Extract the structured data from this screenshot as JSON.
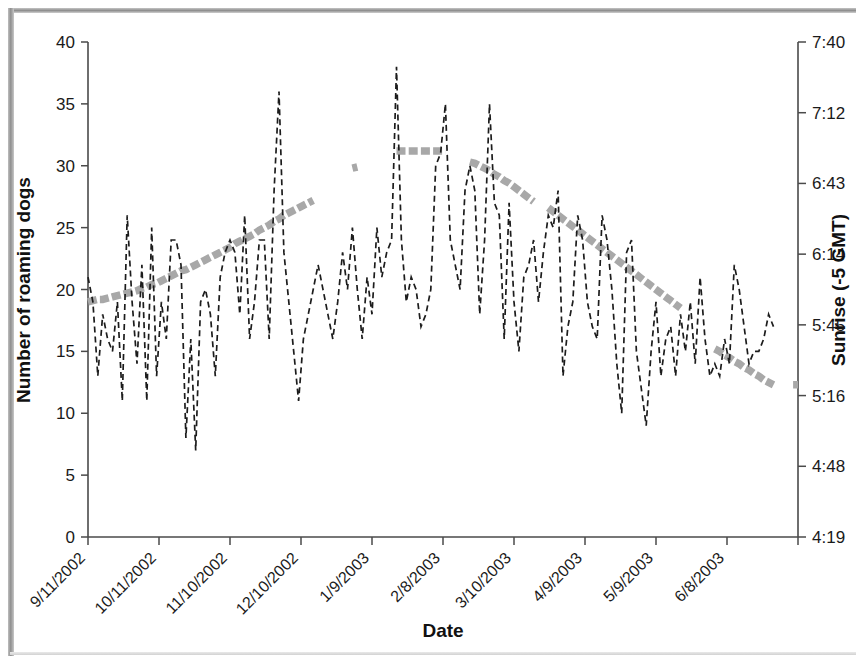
{
  "figure": {
    "background_color": "#ffffff",
    "frame_color": "#8f8f8f"
  },
  "chart_data": {
    "type": "line",
    "title": "",
    "xlabel": "Date",
    "ylabel": "Number of roaming dogs",
    "y2label": "Sunrise (-5 GMT)",
    "grid": false,
    "legend_position": "none",
    "xlim": [
      "9/11/2002",
      "6/28/2003"
    ],
    "ylim": [
      0,
      40
    ],
    "ytick_labels": [
      "0",
      "5",
      "10",
      "15",
      "20",
      "25",
      "30",
      "35",
      "40"
    ],
    "ytick_values": [
      0,
      5,
      10,
      15,
      20,
      25,
      30,
      35,
      40
    ],
    "y2lim": [
      "4:19",
      "7:40"
    ],
    "y2tick_labels": [
      "4:19",
      "4:48",
      "5:16",
      "5:45",
      "6:14",
      "6:43",
      "7:12",
      "7:40"
    ],
    "y2tick_minutes": [
      259,
      288,
      316,
      345,
      374,
      403,
      432,
      460
    ],
    "xtick_labels": [
      "9/11/2002",
      "10/11/2002",
      "11/10/2002",
      "12/10/2002",
      "1/9/2003",
      "2/8/2003",
      "3/10/2003",
      "4/9/2003",
      "5/9/2003",
      "6/8/2003"
    ],
    "series": [
      {
        "name": "Number of roaming dogs",
        "axis": "left",
        "style": "dashed-line",
        "color": "#1c1c1c",
        "x": [
          0,
          1,
          2,
          3,
          4,
          5,
          6,
          7,
          8,
          9,
          10,
          11,
          12,
          13,
          14,
          15,
          16,
          17,
          18,
          19,
          20,
          21,
          22,
          23,
          24,
          25,
          26,
          27,
          28,
          29,
          30,
          31,
          32,
          33,
          34,
          35,
          36,
          37,
          38,
          39,
          40,
          41,
          42,
          43,
          44,
          45,
          46,
          47,
          48,
          49,
          50,
          51,
          52,
          53,
          54,
          55,
          56,
          57,
          58,
          59,
          60,
          61,
          62,
          63,
          64,
          65,
          66,
          67,
          68,
          69,
          70,
          71,
          72,
          73,
          74,
          75,
          76,
          77,
          78,
          79,
          80,
          81,
          82,
          83,
          84,
          85,
          86,
          87,
          88,
          89,
          90,
          91,
          92,
          93,
          94,
          95,
          96,
          97,
          98,
          99,
          100,
          101,
          102,
          103,
          104,
          105,
          106,
          107,
          108,
          109,
          110,
          111,
          112,
          113,
          114,
          115,
          116,
          117,
          118,
          119,
          120,
          121,
          122,
          123,
          124,
          125,
          126,
          127,
          128,
          129,
          130,
          131,
          132,
          133,
          134,
          135,
          136,
          137,
          138,
          139,
          140
        ],
        "values": [
          21,
          19,
          13,
          18,
          16,
          15,
          19,
          11,
          26,
          19,
          14,
          22,
          11,
          25,
          13,
          19,
          16,
          24,
          24,
          22,
          8,
          16,
          7,
          19,
          20,
          18,
          13,
          21,
          23,
          24,
          23,
          18,
          26,
          16,
          19,
          24,
          24,
          16,
          28,
          36,
          23,
          19,
          15,
          11,
          16,
          18,
          20,
          22,
          20,
          18,
          16,
          19,
          23,
          20,
          25,
          20,
          16,
          21,
          18,
          25,
          21,
          23,
          24,
          38,
          24,
          19,
          21,
          20,
          17,
          18,
          20,
          30,
          31,
          35,
          24,
          22,
          20,
          28,
          30,
          28,
          18,
          24,
          35,
          27,
          26,
          16,
          27,
          19,
          15,
          21,
          22,
          24,
          19,
          23,
          26,
          25,
          28,
          13,
          17,
          19,
          26,
          24,
          19,
          17,
          16,
          26,
          24,
          20,
          14,
          10,
          23,
          24,
          15,
          12,
          9,
          15,
          19,
          13,
          16,
          17,
          13,
          18,
          15,
          19,
          14,
          21,
          16,
          13,
          14,
          13,
          16,
          14,
          22,
          20,
          17,
          14,
          15,
          15,
          16,
          18,
          17
        ]
      },
      {
        "name": "Sunrise (-5 GMT)",
        "axis": "right",
        "style": "thick-dotted-line",
        "color": "#a8a8a8",
        "x": [
          0,
          1,
          2,
          3,
          4,
          5,
          6,
          7,
          8,
          9,
          10,
          11,
          12,
          13,
          14,
          15,
          16,
          17,
          18,
          19,
          20,
          21,
          22,
          23,
          24,
          25,
          26,
          27,
          28,
          29,
          30,
          31,
          32,
          33,
          34,
          35,
          36,
          37,
          38,
          39,
          40,
          41,
          42,
          43,
          44,
          45,
          46,
          47,
          48,
          49,
          50,
          51,
          52,
          53,
          54,
          55,
          56,
          57,
          58,
          59,
          60,
          61,
          62,
          63,
          64,
          65,
          66,
          67,
          68,
          69,
          70,
          71,
          72,
          73,
          74,
          75,
          76,
          77,
          78,
          79,
          80,
          81,
          82,
          83,
          84,
          85,
          86,
          87,
          88,
          89,
          90,
          91,
          92,
          93,
          94,
          95,
          96,
          97,
          98,
          99,
          100,
          101,
          102,
          103,
          104,
          105,
          106,
          107,
          108,
          109,
          110,
          111,
          112,
          113,
          114,
          115,
          116,
          117,
          118,
          119,
          120,
          121,
          122,
          123,
          124,
          125,
          126,
          127,
          128,
          129,
          130,
          131,
          132,
          133,
          134,
          135,
          136,
          137,
          138,
          139,
          140
        ],
        "left_scale_equivalent": [
          19,
          19.1,
          19.2,
          19.2,
          19.3,
          19.4,
          19.5,
          19.6,
          19.7,
          19.8,
          19.9,
          20.1,
          20.2,
          20.4,
          20.5,
          20.7,
          20.9,
          21.1,
          21.3,
          21.5,
          21.6,
          21.8,
          22.0,
          22.2,
          22.4,
          22.6,
          22.8,
          23.0,
          23.2,
          23.4,
          23.7,
          23.9,
          24.1,
          24.3,
          24.5,
          24.8,
          25.0,
          25.2,
          25.5,
          25.7,
          26.0,
          26.2,
          26.4,
          26.6,
          26.8,
          27.0,
          27.2,
          null,
          null,
          null,
          29.1,
          null,
          null,
          null,
          29.8,
          29.9,
          null,
          null,
          null,
          null,
          null,
          null,
          null,
          31.2,
          31.2,
          31.2,
          31.2,
          31.2,
          31.2,
          31.2,
          31.2,
          31.2,
          31.2,
          31.2,
          null,
          31.0,
          null,
          null,
          30.3,
          30.2,
          30.0,
          29.8,
          29.6,
          29.3,
          29.1,
          28.8,
          28.6,
          28.3,
          28.0,
          27.7,
          27.4,
          27.1,
          null,
          null,
          26.6,
          26.3,
          26.0,
          25.7,
          25.4,
          25.1,
          24.8,
          24.5,
          24.2,
          23.9,
          23.6,
          23.3,
          23.0,
          22.7,
          22.4,
          22.1,
          21.8,
          21.5,
          21.2,
          20.9,
          20.6,
          20.3,
          20.0,
          19.7,
          19.4,
          19.1,
          18.8,
          18.5,
          null,
          null,
          null,
          null,
          null,
          null,
          15.2,
          15.0,
          14.7,
          14.5,
          14.2,
          14.0,
          13.7,
          13.5,
          13.2,
          13.0,
          12.7,
          12.5,
          12.3,
          null,
          12.2,
          null,
          12.3,
          12.3
        ],
        "notes": "Smooth seasonal sunrise curve; latest sunrise (~7:00) in late December/early January, earliest (~5:25) in June. Gaps where data missing."
      }
    ]
  }
}
